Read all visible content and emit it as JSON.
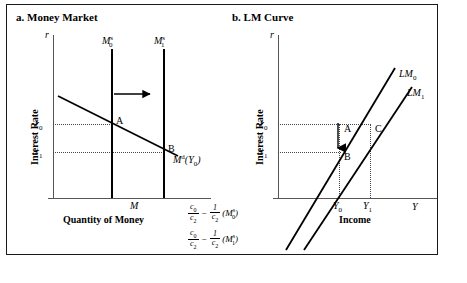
{
  "figure": {
    "panel_a": {
      "title": "a. Money Market",
      "y_axis_symbol": "r",
      "y_axis_title": "Interest Rate",
      "x_axis_title": "Quantity of Money",
      "x_tick": "M",
      "y_ticks": [
        {
          "base": "r",
          "sub": "0"
        },
        {
          "base": "r",
          "sub": "1"
        }
      ],
      "supply_curves": [
        {
          "base": "M",
          "sub": "0",
          "sup": "s"
        },
        {
          "base": "M",
          "sub": "1",
          "sup": "s"
        }
      ],
      "demand_curve": {
        "base": "M",
        "sup": "d",
        "arg_base": "Y",
        "arg_sub": "0"
      },
      "points": [
        "A",
        "B"
      ],
      "shift_arrow": "rightward-arrow"
    },
    "panel_b": {
      "title": "b. LM Curve",
      "y_axis_symbol": "r",
      "y_axis_title": "Interest Rate",
      "x_axis_title": "Income",
      "x_axis_symbol": "Y",
      "y_ticks": [
        {
          "base": "r",
          "sub": "0"
        },
        {
          "base": "r",
          "sub": "1"
        }
      ],
      "x_ticks": [
        {
          "base": "Y",
          "sub": "0"
        },
        {
          "base": "Y",
          "sub": "1"
        }
      ],
      "lm_curves": [
        {
          "base": "LM",
          "sub": "0"
        },
        {
          "base": "LM",
          "sub": "1"
        }
      ],
      "points": [
        "A",
        "B",
        "C"
      ],
      "shift_arrow": "downward-arrow",
      "intercepts": [
        {
          "frac1_num": "c",
          "frac1_num_sub": "0",
          "frac1_den": "c",
          "frac1_den_sub": "2",
          "operator": "−",
          "frac2_num": "1",
          "frac2_den": "c",
          "frac2_den_sub": "2",
          "term": "M",
          "term_sub": "0",
          "term_sup": "s"
        },
        {
          "frac1_num": "c",
          "frac1_num_sub": "0",
          "frac1_den": "c",
          "frac1_den_sub": "2",
          "operator": "−",
          "frac2_num": "1",
          "frac2_den": "c",
          "frac2_den_sub": "2",
          "term": "M",
          "term_sub": "1",
          "term_sup": "s"
        }
      ]
    }
  },
  "colors": {
    "line": "#000000",
    "axis": "#555555",
    "border": "#1a1a1a",
    "shadow": "#6e6e6e",
    "background": "#ffffff"
  }
}
